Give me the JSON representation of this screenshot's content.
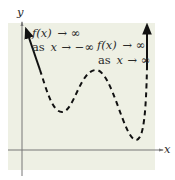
{
  "figure": {
    "type": "polynomial end-behavior sketch",
    "background_color": "#eef0e4",
    "axis_color": "#777777",
    "curve_color": "#111111",
    "axes": {
      "x_label": "x",
      "y_label": "y"
    },
    "annotations": {
      "left": {
        "line1_func": "f(x)",
        "line1_arrow": "→ ∞",
        "line2_as": "as",
        "line2_var": "x",
        "line2_arrow": "→ −∞"
      },
      "right": {
        "line1_func": "f(x)",
        "line1_arrow": "→ ∞",
        "line2_as": "as",
        "line2_var": "x",
        "line2_arrow": "→ ∞"
      }
    },
    "curve": {
      "style": "dashed middle with solid arrow ends",
      "features": [
        "rises to infinity on left",
        "local minimum",
        "local maximum",
        "lower local minimum",
        "rises to infinity on right"
      ]
    }
  }
}
